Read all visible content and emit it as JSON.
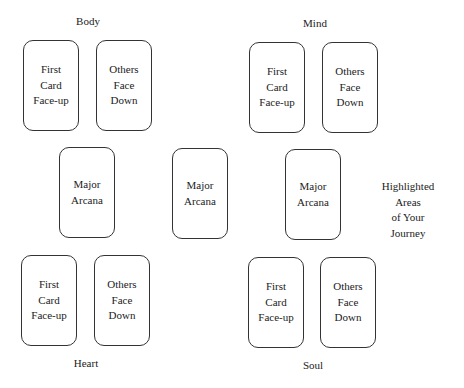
{
  "groups": {
    "body": {
      "label": "Body",
      "cards": [
        "First\nCard\nFace-up",
        "Others\nFace\nDown"
      ]
    },
    "mind": {
      "label": "Mind",
      "cards": [
        "First\nCard\nFace-up",
        "Others\nFace\nDown"
      ]
    },
    "heart": {
      "label": "Heart",
      "cards": [
        "First\nCard\nFace-up",
        "Others\nFace\nDown"
      ]
    },
    "soul": {
      "label": "Soul",
      "cards": [
        "First\nCard\nFace-up",
        "Others\nFace\nDown"
      ]
    }
  },
  "major_arcana": [
    "Major\nArcana",
    "Major\nArcana",
    "Major\nArcana"
  ],
  "note": "Highlighted Areas\nof Your Journey"
}
